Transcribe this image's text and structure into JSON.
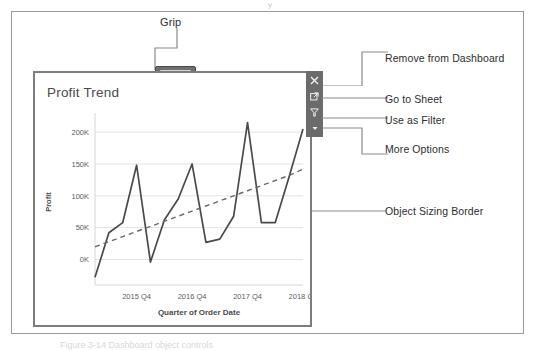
{
  "figure": {
    "top_artifact": "y",
    "caption_remnant": "Figure 3-14  Dashboard object controls"
  },
  "grip": {
    "label": "Grip",
    "handle_name": "object-grip-handle"
  },
  "worksheet": {
    "title": "Profit Trend"
  },
  "toolbar": {
    "buttons": [
      {
        "name": "remove-from-dashboard-button",
        "icon": "close-icon",
        "tooltip": "Remove from Dashboard"
      },
      {
        "name": "go-to-sheet-button",
        "icon": "external-link-icon",
        "tooltip": "Go to Sheet"
      },
      {
        "name": "use-as-filter-button",
        "icon": "funnel-icon",
        "tooltip": "Use as Filter"
      },
      {
        "name": "more-options-button",
        "icon": "caret-down-icon",
        "tooltip": "More Options"
      }
    ],
    "background": "#6b6b6b"
  },
  "callouts": [
    {
      "name": "callout-remove-from-dashboard",
      "text": "Remove from Dashboard"
    },
    {
      "name": "callout-go-to-sheet",
      "text": "Go to Sheet"
    },
    {
      "name": "callout-use-as-filter",
      "text": "Use as Filter"
    },
    {
      "name": "callout-more-options",
      "text": "More Options"
    },
    {
      "name": "callout-object-sizing-border",
      "text": "Object Sizing Border"
    }
  ],
  "chart_data": {
    "type": "line",
    "title": "Profit Trend",
    "xlabel": "Quarter of Order Date",
    "ylabel": "Profit",
    "grid": true,
    "legend": false,
    "ylim": [
      -40000,
      230000
    ],
    "yticks": [
      0,
      50000,
      100000,
      150000,
      200000
    ],
    "ytick_labels": [
      "0K",
      "50K",
      "100K",
      "150K",
      "200K"
    ],
    "xtick_labels": [
      "2015 Q4",
      "2016 Q4",
      "2017 Q4",
      "2018 Q4"
    ],
    "xtick_positions": [
      3,
      7,
      11,
      15
    ],
    "x": [
      "2015 Q1",
      "2015 Q2",
      "2015 Q3",
      "2015 Q4",
      "2016 Q1",
      "2016 Q2",
      "2016 Q3",
      "2016 Q4",
      "2017 Q1",
      "2017 Q2",
      "2017 Q3",
      "2017 Q4",
      "2018 Q1",
      "2018 Q2",
      "2018 Q3",
      "2018 Q4"
    ],
    "series": [
      {
        "name": "Profit",
        "style": "solid",
        "color": "#4a4a4a",
        "values": [
          -28000,
          42000,
          58000,
          148000,
          -4000,
          62000,
          95000,
          150000,
          27000,
          32000,
          68000,
          215000,
          58000,
          58000,
          130000,
          205000
        ]
      },
      {
        "name": "Trend Line",
        "style": "dashed",
        "color": "#6a6a6a",
        "values": [
          20000,
          28000,
          36000,
          44000,
          52000,
          60000,
          68000,
          76000,
          84000,
          92000,
          100000,
          108000,
          116000,
          124000,
          132000,
          142000
        ]
      }
    ]
  }
}
